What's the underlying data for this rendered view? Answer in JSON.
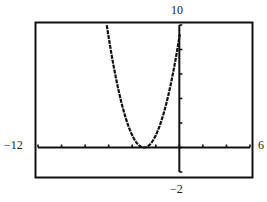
{
  "chart_data": {
    "type": "line",
    "title": "",
    "xlabel": "",
    "ylabel": "",
    "xlim": [
      -12,
      6
    ],
    "ylim": [
      -2,
      10
    ],
    "x_tick_step": 2,
    "y_tick_step": 2,
    "grid": false,
    "legend": null,
    "window_labels": {
      "xmin": "−12",
      "xmax": "6",
      "ymin": "−2",
      "ymax": "10"
    },
    "series": [
      {
        "name": "y = (x + 3)^2",
        "function": "x^2 + 6x + 9",
        "vertex": [
          -3,
          0
        ],
        "x": [
          -6.2,
          -6,
          -5.5,
          -5,
          -4.5,
          -4,
          -3.5,
          -3,
          -2.5,
          -2,
          -1.5,
          -1,
          -0.5,
          0
        ],
        "y": [
          10.24,
          9,
          6.25,
          4,
          2.25,
          1,
          0.25,
          0,
          0.25,
          1,
          2.25,
          4,
          6.25,
          9
        ]
      }
    ]
  },
  "colors": {
    "frame": "#111111",
    "axes": "#111111",
    "curve": "#111111",
    "background": "#ffffff"
  }
}
